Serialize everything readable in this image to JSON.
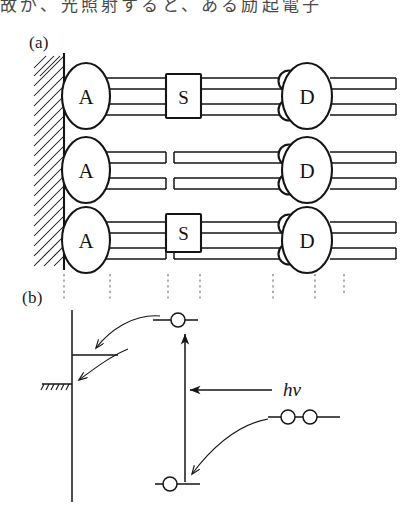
{
  "figure": {
    "top_caption_line": "故が、光照射すると、ある励起電子",
    "panels": [
      {
        "id": "a",
        "label": "(a)"
      },
      {
        "id": "b",
        "label": "(b)"
      }
    ]
  },
  "panel_a": {
    "label": "(a)",
    "description": "Three molecular wires anchored on a hatched electrode surface",
    "electrode": {
      "name": "electrode-wall",
      "hatched": true
    },
    "rows": [
      {
        "acceptor_label": "A",
        "spacer_label": "S",
        "donor_label": "D",
        "has_spacer": true,
        "donor_circle_count": 2
      },
      {
        "acceptor_label": "A",
        "spacer_label": "",
        "donor_label": "D",
        "has_spacer": false,
        "donor_circle_count": 2
      },
      {
        "acceptor_label": "A",
        "spacer_label": "S",
        "donor_label": "D",
        "has_spacer": true,
        "donor_circle_count": 2
      }
    ],
    "guide_line_count": 7
  },
  "panel_b": {
    "label": "(b)",
    "description": "Energy level diagram of photoinduced electron transfer",
    "photon_label": "hν",
    "electrode": {
      "name": "fermi-level-electrode",
      "hatched": true
    },
    "levels": [
      {
        "name": "acceptor-excited-level",
        "electrons": 1
      },
      {
        "name": "electrode-fermi-level",
        "electrons": 0
      },
      {
        "name": "donor-ground-level",
        "electrons": 1
      },
      {
        "name": "donor-occupied-level",
        "electrons": 2
      }
    ],
    "arrows": [
      {
        "name": "excitation-arrow",
        "direction": "up",
        "label": "hν"
      },
      {
        "name": "photon-arrow",
        "direction": "left",
        "label": "hν"
      },
      {
        "name": "electron-transfer-arrow-upper",
        "direction": "curved-left"
      },
      {
        "name": "electron-transfer-arrow-lower",
        "direction": "curved-left"
      }
    ]
  },
  "colors": {
    "ink": "#151515",
    "guide": "#6a6a6a",
    "paper": "#ffffff"
  }
}
